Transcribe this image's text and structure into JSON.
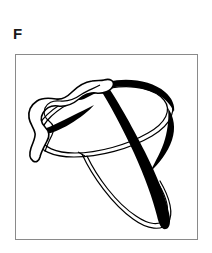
{
  "figure": {
    "panel_label": "F",
    "caption": "",
    "background_color": "#ffffff",
    "frame": {
      "stroke_color": "#8a8a8a",
      "stroke_width": 1,
      "x": 15,
      "y": 54,
      "width": 183,
      "height": 186
    },
    "drawing": {
      "title": "line-drawing-object",
      "description": "Abstract black-and-white contour line drawing of an object resembling a tilted elliptical ring with a thick black band sweeping across it and a wavy irregular band overlapping the upper-left side, plus a narrow elongated loop descending below.",
      "ink_color": "#000000",
      "fill_color": "#ffffff",
      "thin_stroke_width": 1,
      "thick_stroke_width": 7,
      "parts": [
        {
          "name": "main-ellipse-ring",
          "style": "thin double contour",
          "stroke": "#000000"
        },
        {
          "name": "thick-black-band",
          "style": "solid filled black sweep",
          "stroke": "#000000"
        },
        {
          "name": "wavy-band-upper-left",
          "style": "outlined wavy band",
          "stroke": "#000000"
        },
        {
          "name": "lower-narrow-loop",
          "style": "thin double contour",
          "stroke": "#000000"
        }
      ]
    }
  }
}
